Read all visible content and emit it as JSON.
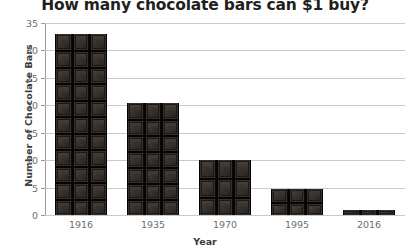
{
  "chart_data": {
    "type": "bar",
    "title": "How many chocolate bars can $1 buy?",
    "xlabel": "Year",
    "ylabel": "Number of Chocolate Bars",
    "categories": [
      "1916",
      "1935",
      "1970",
      "1995",
      "2016"
    ],
    "values": [
      33,
      20.5,
      10,
      4.7,
      1
    ],
    "ylim": [
      0,
      35
    ],
    "ytick_labels": [
      "0",
      "5",
      "10",
      "15",
      "20",
      "25",
      "30",
      "35"
    ],
    "ytick_values": [
      0,
      5,
      10,
      15,
      20,
      25,
      30,
      35
    ],
    "grid": true,
    "legend": "none",
    "bar_color": "#2a2623",
    "gridline_color": "#c9c9c9",
    "axis_color": "#9a9a9a",
    "tick_label_color": "#6d6d6d",
    "title_color": "#231f20"
  }
}
